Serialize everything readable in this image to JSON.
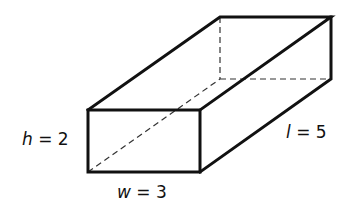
{
  "diagram": {
    "type": "rectangular box (cuboid)",
    "labels": {
      "height": {
        "var": "h",
        "eq": " = 2"
      },
      "width": {
        "var": "w",
        "eq": " = 3"
      },
      "length": {
        "var": "l",
        "eq": " = 5"
      }
    },
    "colors": {
      "stroke": "#111111",
      "background": "#ffffff"
    }
  }
}
